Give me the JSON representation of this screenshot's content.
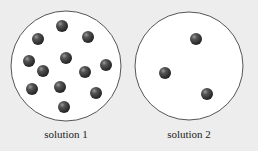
{
  "diagram": {
    "background": "#ededed",
    "circle_fill": "#ffffff",
    "circle_stroke": "#555555",
    "particle_color": "#3a3a3a",
    "particle_highlight": "#8a8a8a",
    "particle_radius": 6,
    "solutions": [
      {
        "label": "solution 1",
        "particle_count": 12,
        "circle": {
          "cx": 66,
          "cy": 66,
          "r": 55
        },
        "label_x": 66,
        "particles": [
          {
            "x": 62,
            "y": 26
          },
          {
            "x": 38,
            "y": 39
          },
          {
            "x": 88,
            "y": 37
          },
          {
            "x": 29,
            "y": 61
          },
          {
            "x": 66,
            "y": 58
          },
          {
            "x": 106,
            "y": 65
          },
          {
            "x": 43,
            "y": 71
          },
          {
            "x": 85,
            "y": 72
          },
          {
            "x": 32,
            "y": 89
          },
          {
            "x": 60,
            "y": 87
          },
          {
            "x": 96,
            "y": 93
          },
          {
            "x": 64,
            "y": 107
          }
        ]
      },
      {
        "label": "solution 2",
        "particle_count": 3,
        "circle": {
          "cx": 189,
          "cy": 66,
          "r": 54
        },
        "label_x": 189,
        "particles": [
          {
            "x": 196,
            "y": 39
          },
          {
            "x": 165,
            "y": 73
          },
          {
            "x": 207,
            "y": 94
          }
        ]
      }
    ]
  }
}
